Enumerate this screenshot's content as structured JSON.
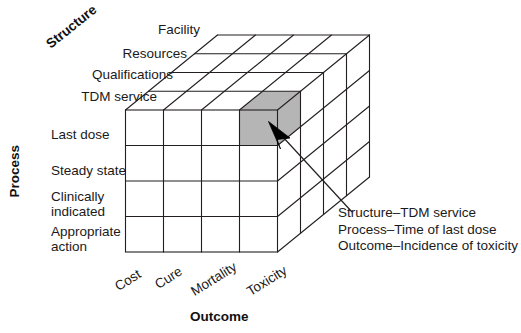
{
  "figure": {
    "type": "3d-quality-cube-diagram",
    "axes": {
      "structure": {
        "title": "Structure",
        "labels": [
          "Facility",
          "Resources",
          "Qualifications",
          "TDM service"
        ]
      },
      "process": {
        "title": "Process",
        "labels": [
          "Last dose",
          "Steady state",
          "Clinically indicated",
          "Appropriate action"
        ]
      },
      "outcome": {
        "title": "Outcome",
        "labels": [
          "Cost",
          "Cure",
          "Mortality",
          "Toxicity"
        ]
      }
    },
    "highlighted_cell": {
      "fill_color": "#b5b5b5",
      "structure_index": 3,
      "process_index": 0,
      "outcome_index": 3
    },
    "annotation": {
      "lines": [
        "Structure–TDM service",
        "Process–Time of last dose",
        "Outcome–Incidence of toxicity"
      ]
    },
    "colors": {
      "stroke": "#231f20",
      "background": "#ffffff",
      "highlight": "#b5b5b5",
      "highlight_top": "#b5b5b5",
      "highlight_side": "#b5b5b5"
    }
  }
}
